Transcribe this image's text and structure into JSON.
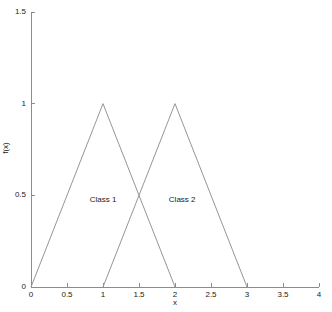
{
  "chart_data": {
    "type": "line",
    "title": "",
    "subtitle": "",
    "xlabel": "x",
    "ylabel": "f(x)",
    "xlim": [
      0,
      4
    ],
    "ylim": [
      0,
      1.5
    ],
    "grid": false,
    "legend": "none",
    "xticks": [
      0,
      0.5,
      1,
      1.5,
      2,
      2.5,
      3,
      3.5,
      4
    ],
    "xticklabels": [
      "0",
      "0.5",
      "1",
      "1.5",
      "2",
      "2.5",
      "3",
      "3.5",
      "4"
    ],
    "yticks": [
      0,
      0.5,
      1,
      1.5
    ],
    "yticklabels": [
      "0",
      "0.5",
      "1",
      "1.5"
    ],
    "line_color": "#969696",
    "axis_color": "#8c8c8c",
    "text_color": "#1a1a1a",
    "background": "#ffffff",
    "series": [
      {
        "name": "Class 1",
        "x": [
          0,
          1,
          2
        ],
        "values": [
          0,
          1,
          0
        ]
      },
      {
        "name": "Class 2",
        "x": [
          1,
          2,
          3
        ],
        "values": [
          0,
          1,
          0
        ]
      }
    ],
    "annotations": [
      {
        "text": "Class 1",
        "x": 1.0,
        "y": 0.475
      },
      {
        "text": "Class 2",
        "x": 2.1,
        "y": 0.475
      }
    ]
  }
}
